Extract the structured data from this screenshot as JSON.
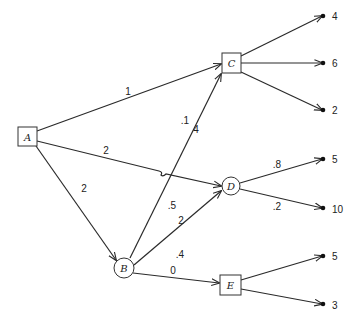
{
  "diagram": {
    "type": "decision-tree",
    "nodes": [
      {
        "id": "A",
        "label": "A",
        "shape": "box"
      },
      {
        "id": "B",
        "label": "B",
        "shape": "circle"
      },
      {
        "id": "C",
        "label": "C",
        "shape": "box"
      },
      {
        "id": "D",
        "label": "D",
        "shape": "circle"
      },
      {
        "id": "E",
        "label": "E",
        "shape": "box"
      }
    ],
    "edges": [
      {
        "from": "A",
        "to": "C",
        "label": "1"
      },
      {
        "from": "A",
        "to": "D",
        "label": "2"
      },
      {
        "from": "A",
        "to": "B",
        "label": "2"
      },
      {
        "from": "B",
        "to": "C",
        "label_prob": ".1",
        "label_cost": "4"
      },
      {
        "from": "B",
        "to": "D",
        "label_prob": ".5",
        "label_cost": "2"
      },
      {
        "from": "B",
        "to": "E",
        "label_prob": ".4",
        "label_cost": "0"
      },
      {
        "from": "D",
        "to": "T5a",
        "label": ".8"
      },
      {
        "from": "D",
        "to": "T10",
        "label": ".2"
      }
    ],
    "terminals": [
      {
        "from": "C",
        "value": "4"
      },
      {
        "from": "C",
        "value": "6"
      },
      {
        "from": "C",
        "value": "2"
      },
      {
        "from": "D",
        "value": "5"
      },
      {
        "from": "D",
        "value": "10"
      },
      {
        "from": "E",
        "value": "5"
      },
      {
        "from": "E",
        "value": "3"
      }
    ]
  }
}
